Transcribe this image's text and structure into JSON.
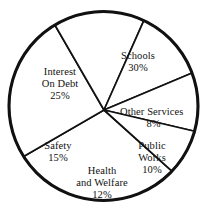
{
  "chart_data": {
    "type": "pie",
    "title": "",
    "subtitle": "",
    "xlabel": "",
    "ylabel": "",
    "legend": "none",
    "grid": false,
    "units": "percent",
    "total": 100,
    "start_angle_deg": 0,
    "direction": "clockwise",
    "categories": [
      "Other Services",
      "Public Works",
      "Health and Welfare",
      "Safety",
      "Interest On Debt",
      "Schools"
    ],
    "values": [
      8,
      10,
      12,
      15,
      25,
      30
    ],
    "slices": [
      {
        "name": "Schools",
        "label_line1": "Schools",
        "label_line2": "",
        "value": 30,
        "value_label": "30%",
        "start_deg": 210,
        "end_deg": 318,
        "fill": "#ffffff",
        "stroke": "#111111"
      },
      {
        "name": "Interest On Debt",
        "label_line1": "Interest",
        "label_line2": "On Debt",
        "value": 25,
        "value_label": "25%",
        "start_deg": 120,
        "end_deg": 210,
        "fill": "#ffffff",
        "stroke": "#111111"
      },
      {
        "name": "Safety",
        "label_line1": "Safety",
        "label_line2": "",
        "value": 15,
        "value_label": "15%",
        "start_deg": 66,
        "end_deg": 120,
        "fill": "#ffffff",
        "stroke": "#111111"
      },
      {
        "name": "Health and Welfare",
        "label_line1": "Health",
        "label_line2": "and Welfare",
        "value": 12,
        "value_label": "12%",
        "start_deg": 22.8,
        "end_deg": 66,
        "fill": "#ffffff",
        "stroke": "#111111"
      },
      {
        "name": "Public Works",
        "label_line1": "Public",
        "label_line2": "Works",
        "value": 10,
        "value_label": "10%",
        "start_deg": -13.2,
        "end_deg": 22.8,
        "fill": "#ffffff",
        "stroke": "#111111"
      },
      {
        "name": "Other Services",
        "label_line1": "Other Services",
        "label_line2": "",
        "value": 8,
        "value_label": "8%",
        "start_deg": -42,
        "end_deg": -13.2,
        "fill": "#ffffff",
        "stroke": "#111111"
      }
    ]
  },
  "labels": {
    "schools": {
      "name": "Schools",
      "value": "30%"
    },
    "interest": {
      "name_line1": "Interest",
      "name_line2": "On Debt",
      "value": "25%"
    },
    "other_services": {
      "name": "Other Services",
      "value": "8%"
    },
    "public_works": {
      "name_line1": "Public",
      "name_line2": "Works",
      "value": "10%"
    },
    "safety": {
      "name": "Safety",
      "value": "15%"
    },
    "health": {
      "name_line1": "Health",
      "name_line2": "and Welfare",
      "value": "12%"
    }
  },
  "style": {
    "background": "#ffffff",
    "line_color": "#111111",
    "text_color": "#111111"
  }
}
